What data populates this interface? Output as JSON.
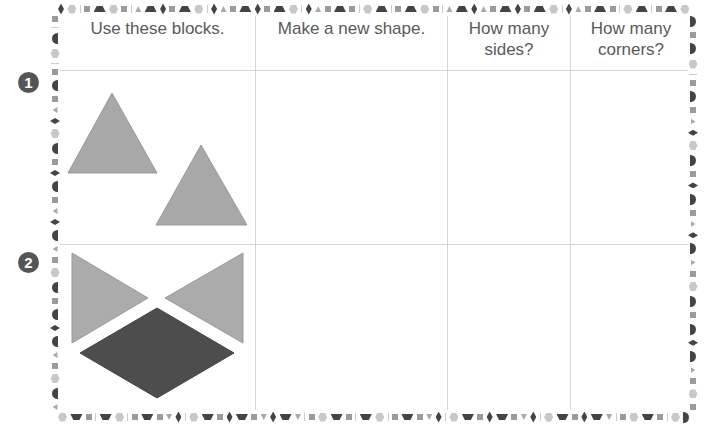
{
  "worksheet": {
    "headers": [
      {
        "label": "Use these blocks."
      },
      {
        "label": "Make a new shape."
      },
      {
        "label": "How many sides?",
        "line1": "How many",
        "line2": "sides?"
      },
      {
        "label": "How many corners?",
        "line1": "How many",
        "line2": "corners?"
      }
    ],
    "rows": [
      {
        "number": "1",
        "blocks": [
          "triangle",
          "triangle"
        ],
        "new_shape": "",
        "sides": "",
        "corners": ""
      },
      {
        "number": "2",
        "blocks": [
          "triangle",
          "triangle",
          "rhombus"
        ],
        "new_shape": "",
        "sides": "",
        "corners": ""
      }
    ]
  },
  "colors": {
    "triangle": "#a8a8a8",
    "rhombus": "#4d4d4d",
    "badge": "#555555",
    "grid": "#d6d6d6",
    "text": "#5a5a5a"
  }
}
